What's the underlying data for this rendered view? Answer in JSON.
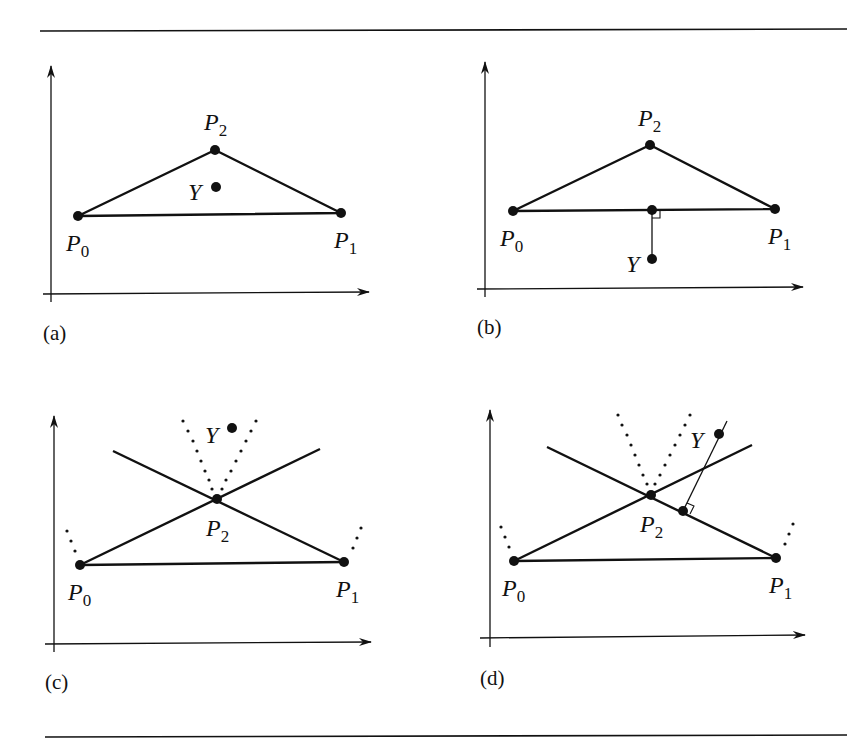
{
  "figure": {
    "panels": [
      {
        "id": "a",
        "caption": "(a)",
        "points": {
          "P0": {
            "name": "P",
            "sub": "0",
            "x": 78,
            "y": 216
          },
          "P1": {
            "name": "P",
            "sub": "1",
            "x": 341,
            "y": 213
          },
          "P2": {
            "name": "P",
            "sub": "2",
            "x": 215,
            "y": 150
          },
          "Y": {
            "name": "Y",
            "x": 216,
            "y": 187
          }
        },
        "description": "Point Y inside triangle P0 P1 P2"
      },
      {
        "id": "b",
        "caption": "(b)",
        "points": {
          "P0": {
            "name": "P",
            "sub": "0",
            "x": 513,
            "y": 211
          },
          "P1": {
            "name": "P",
            "sub": "1",
            "x": 775,
            "y": 209
          },
          "P2": {
            "name": "P",
            "sub": "2",
            "x": 650,
            "y": 145
          },
          "Y": {
            "name": "Y",
            "x": 652,
            "y": 259
          }
        },
        "description": "Y below edge P0P1, perpendicular projection onto edge"
      },
      {
        "id": "c",
        "caption": "(c)",
        "points": {
          "P0": {
            "name": "P",
            "sub": "0",
            "x": 80,
            "y": 565
          },
          "P1": {
            "name": "P",
            "sub": "1",
            "x": 344,
            "y": 562
          },
          "P2": {
            "name": "P",
            "sub": "2",
            "x": 217,
            "y": 499
          },
          "Y": {
            "name": "Y",
            "x": 232,
            "y": 428
          }
        },
        "description": "Y in vertex region of P2 (closest point is P2)"
      },
      {
        "id": "d",
        "caption": "(d)",
        "points": {
          "P0": {
            "name": "P",
            "sub": "0",
            "x": 514,
            "y": 561
          },
          "P1": {
            "name": "P",
            "sub": "1",
            "x": 776,
            "y": 558
          },
          "P2": {
            "name": "P",
            "sub": "2",
            "x": 651,
            "y": 495
          },
          "Y": {
            "name": "Y",
            "x": 719,
            "y": 434
          }
        },
        "description": "Y outside, perpendicular projection onto edge P2P1"
      }
    ],
    "colors": {
      "ink": "#111111",
      "background": "#ffffff"
    }
  }
}
